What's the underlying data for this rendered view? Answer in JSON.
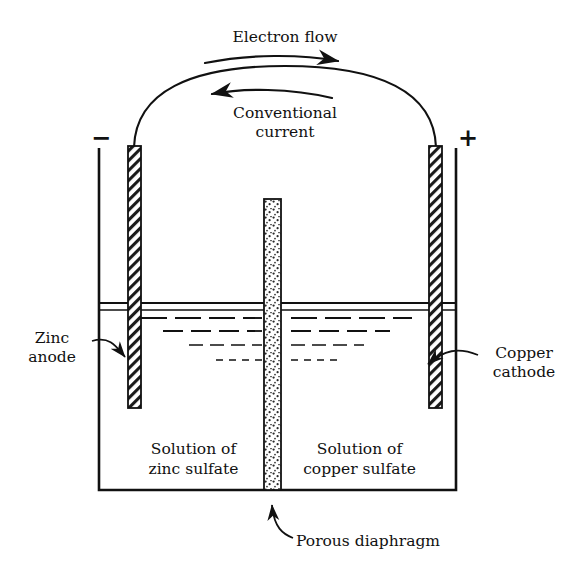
{
  "diagram": {
    "title_top": "Electron flow",
    "title_second_line1": "Conventional",
    "title_second_line2": "current",
    "sign_negative": "−",
    "sign_positive": "+",
    "left_label_line1": "Zinc",
    "left_label_line2": "anode",
    "right_label_line1": "Copper",
    "right_label_line2": "cathode",
    "left_solution_line1": "Solution of",
    "left_solution_line2": "zinc sulfate",
    "right_solution_line1": "Solution of",
    "right_solution_line2": "copper sulfate",
    "bottom_label": "Porous diaphragm",
    "colors": {
      "ink": "#111111",
      "background": "#ffffff",
      "hatch": "#1a1a1a",
      "stipple": "#2a2a2a"
    },
    "icons": {
      "electron_arrow": "arrow-right-icon",
      "current_arrow": "arrow-left-icon",
      "zinc_leader": "leader-arrow-icon",
      "copper_leader": "leader-arrow-icon",
      "diaphragm_leader": "leader-arrow-icon"
    }
  }
}
